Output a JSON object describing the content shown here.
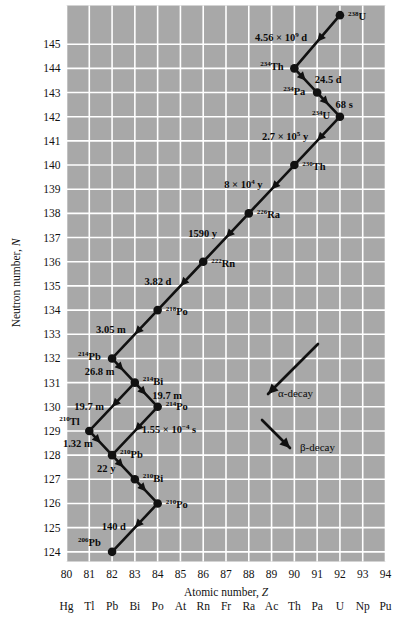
{
  "chart_data": {
    "type": "scatter",
    "title": "",
    "xlabel": "Atomic number, Z",
    "ylabel": "Neutron number, N",
    "xlim": [
      80,
      94
    ],
    "ylim": [
      123.6,
      146.6
    ],
    "grid": true,
    "plot_bg": "#a8a8a8",
    "grid_color": "#ffffff",
    "series_color": "#111111",
    "xticks": [
      "80",
      "81",
      "82",
      "83",
      "84",
      "85",
      "86",
      "87",
      "88",
      "89",
      "90",
      "91",
      "92",
      "93",
      "94"
    ],
    "element_symbols": [
      "Hg",
      "Tl",
      "Pb",
      "Bi",
      "Po",
      "At",
      "Rn",
      "Fr",
      "Ra",
      "Ac",
      "Th",
      "Pa",
      "U",
      "Np",
      "Pu"
    ],
    "yticks": [
      "145",
      "144",
      "143",
      "142",
      "141",
      "140",
      "139",
      "138",
      "137",
      "136",
      "135",
      "134",
      "133",
      "132",
      "131",
      "130",
      "129",
      "128",
      "127",
      "126",
      "125",
      "124"
    ],
    "nuclides": [
      {
        "id": "U238",
        "label_mass": "238",
        "label_sym": "U",
        "Z": 92,
        "N": 146.2,
        "label_dx": 8,
        "label_dy": 5
      },
      {
        "id": "Th234",
        "label_mass": "234",
        "label_sym": "Th",
        "Z": 90,
        "N": 144,
        "label_dx": -34,
        "label_dy": 2
      },
      {
        "id": "Pa234",
        "label_mass": "234",
        "label_sym": "Pa",
        "Z": 91,
        "N": 143,
        "label_dx": -34,
        "label_dy": 2
      },
      {
        "id": "U234",
        "label_mass": "234",
        "label_sym": "U",
        "Z": 92,
        "N": 142,
        "label_dx": -28,
        "label_dy": 2
      },
      {
        "id": "Th230",
        "label_mass": "230",
        "label_sym": "Th",
        "Z": 90,
        "N": 140,
        "label_dx": 8,
        "label_dy": 5
      },
      {
        "id": "Ra226",
        "label_mass": "226",
        "label_sym": "Ra",
        "Z": 88,
        "N": 138,
        "label_dx": 8,
        "label_dy": 5
      },
      {
        "id": "Rn222",
        "label_mass": "222",
        "label_sym": "Rn",
        "Z": 86,
        "N": 136,
        "label_dx": 8,
        "label_dy": 5
      },
      {
        "id": "Po218",
        "label_mass": "218",
        "label_sym": "Po",
        "Z": 84,
        "N": 134,
        "label_dx": 8,
        "label_dy": 5
      },
      {
        "id": "Pb214",
        "label_mass": "214",
        "label_sym": "Pb",
        "Z": 82,
        "N": 132,
        "label_dx": -34,
        "label_dy": 2
      },
      {
        "id": "Bi214",
        "label_mass": "214",
        "label_sym": "Bi",
        "Z": 83,
        "N": 131,
        "label_dx": 8,
        "label_dy": 2
      },
      {
        "id": "Po214",
        "label_mass": "214",
        "label_sym": "Po",
        "Z": 84,
        "N": 130,
        "label_dx": 8,
        "label_dy": 3
      },
      {
        "id": "Tl210",
        "label_mass": "210",
        "label_sym": "Tl",
        "Z": 81,
        "N": 129,
        "label_dx": -30,
        "label_dy": -6
      },
      {
        "id": "Pb210",
        "label_mass": "210",
        "label_sym": "Pb",
        "Z": 82,
        "N": 128,
        "label_dx": 8,
        "label_dy": 3
      },
      {
        "id": "Bi210",
        "label_mass": "210",
        "label_sym": "Bi",
        "Z": 83,
        "N": 127,
        "label_dx": 8,
        "label_dy": 3
      },
      {
        "id": "Po210",
        "label_mass": "210",
        "label_sym": "Po",
        "Z": 84,
        "N": 126,
        "label_dx": 8,
        "label_dy": 5
      },
      {
        "id": "Pb206",
        "label_mass": "206",
        "label_sym": "Pb",
        "Z": 82,
        "N": 124,
        "label_dx": -34,
        "label_dy": -6
      }
    ],
    "decays": [
      {
        "from": "U238",
        "to": "Th234",
        "mode": "alpha",
        "half_life": "4.56 × 10⁹ d",
        "hl_text": "4.56 × 10",
        "hl_exp": "9",
        "hl_unit": " d",
        "lbl_anchor": "end",
        "lbl_dx": -10,
        "lbl_dy": -1
      },
      {
        "from": "Th234",
        "to": "Pa234",
        "mode": "beta",
        "half_life": "24.5 d",
        "hl_text": "24.5 d",
        "hl_exp": "",
        "hl_unit": "",
        "lbl_anchor": "start",
        "lbl_dx": 9,
        "lbl_dy": 3
      },
      {
        "from": "Pa234",
        "to": "U234",
        "mode": "beta",
        "half_life": "68 s",
        "hl_text": "68 s",
        "hl_exp": "",
        "hl_unit": "",
        "lbl_anchor": "start",
        "lbl_dx": 7,
        "lbl_dy": 3
      },
      {
        "from": "U234",
        "to": "Th230",
        "mode": "alpha",
        "half_life": "2.7 × 10⁵ y",
        "hl_text": "2.7 × 10",
        "hl_exp": "5",
        "hl_unit": " y",
        "lbl_anchor": "end",
        "lbl_dx": -9,
        "lbl_dy": -1
      },
      {
        "from": "Th230",
        "to": "Ra226",
        "mode": "alpha",
        "half_life": "8 × 10⁴ y",
        "hl_text": "8 × 10",
        "hl_exp": "4",
        "hl_unit": " y",
        "lbl_anchor": "end",
        "lbl_dx": -9,
        "lbl_dy": -1
      },
      {
        "from": "Ra226",
        "to": "Rn222",
        "mode": "alpha",
        "half_life": "1590 y",
        "hl_text": "1590 y",
        "hl_exp": "",
        "hl_unit": "",
        "lbl_anchor": "end",
        "lbl_dx": -9,
        "lbl_dy": -1
      },
      {
        "from": "Rn222",
        "to": "Po218",
        "mode": "alpha",
        "half_life": "3.82 d",
        "hl_text": "3.82 d",
        "hl_exp": "",
        "hl_unit": "",
        "lbl_anchor": "end",
        "lbl_dx": -9,
        "lbl_dy": -1
      },
      {
        "from": "Po218",
        "to": "Pb214",
        "mode": "alpha",
        "half_life": "3.05 m",
        "hl_text": "3.05 m",
        "hl_exp": "",
        "hl_unit": "",
        "lbl_anchor": "end",
        "lbl_dx": -9,
        "lbl_dy": -1
      },
      {
        "from": "Pb214",
        "to": "Bi214",
        "mode": "beta",
        "half_life": "26.8 m",
        "hl_text": "26.8 m",
        "hl_exp": "",
        "hl_unit": "",
        "lbl_anchor": "end",
        "lbl_dx": -9,
        "lbl_dy": 4
      },
      {
        "from": "Bi214",
        "to": "Po214",
        "mode": "beta",
        "half_life": "19.7 m",
        "hl_text": "19.7 m",
        "hl_exp": "",
        "hl_unit": "",
        "lbl_anchor": "start",
        "lbl_dx": 6,
        "lbl_dy": 4
      },
      {
        "from": "Bi214",
        "to": "Tl210",
        "mode": "alpha",
        "half_life": "19.7 m",
        "hl_text": "19.7 m",
        "hl_exp": "",
        "hl_unit": "",
        "lbl_anchor": "end",
        "lbl_dx": -8,
        "lbl_dy": 3
      },
      {
        "from": "Po214",
        "to": "Pb210",
        "mode": "alpha",
        "half_life": "1.55 × 10⁻⁴ s",
        "hl_text": "1.55 × 10",
        "hl_exp": "−4",
        "hl_unit": " s",
        "lbl_anchor": "start",
        "lbl_dx": 7,
        "lbl_dy": 2
      },
      {
        "from": "Tl210",
        "to": "Pb210",
        "mode": "beta",
        "half_life": "1.32 m",
        "hl_text": "1.32 m",
        "hl_exp": "",
        "hl_unit": "",
        "lbl_anchor": "end",
        "lbl_dx": -8,
        "lbl_dy": 4
      },
      {
        "from": "Pb210",
        "to": "Bi210",
        "mode": "beta",
        "half_life": "22 y",
        "hl_text": "22 y",
        "hl_exp": "",
        "hl_unit": "",
        "lbl_anchor": "end",
        "lbl_dx": -8,
        "lbl_dy": 5
      },
      {
        "from": "Bi210",
        "to": "Po210",
        "mode": "beta",
        "half_life": "5.01 d",
        "hl_text": "",
        "hl_exp": "",
        "hl_unit": "",
        "lbl_anchor": "end",
        "lbl_dx": 0,
        "lbl_dy": 0
      },
      {
        "from": "Po210",
        "to": "Pb206",
        "mode": "alpha",
        "half_life": "140 d",
        "hl_text": "140 d",
        "hl_exp": "",
        "hl_unit": "",
        "lbl_anchor": "end",
        "lbl_dx": -9,
        "lbl_dy": 2
      }
    ],
    "legend": {
      "position": "inside-right",
      "entries": [
        {
          "id": "alpha",
          "label": "α-decay",
          "dir": "down-left"
        },
        {
          "id": "beta",
          "label": "β-decay",
          "dir": "down-right"
        }
      ]
    }
  }
}
